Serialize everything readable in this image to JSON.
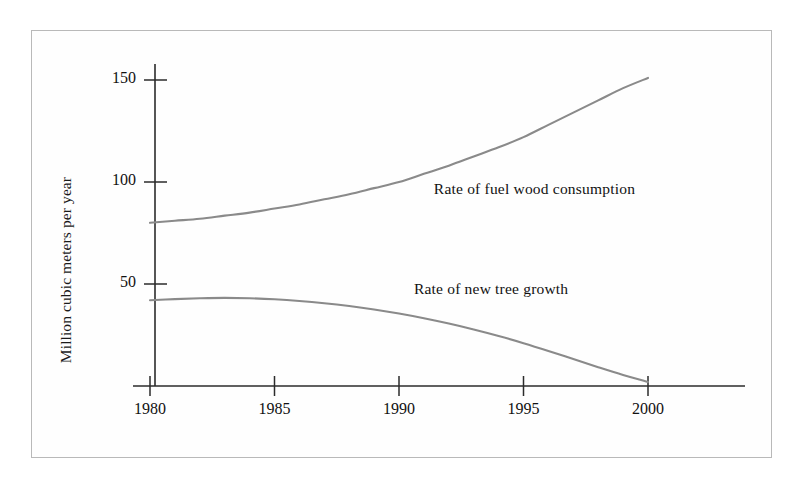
{
  "chart_data": {
    "type": "line",
    "title": "",
    "xlabel": "",
    "ylabel": "Million cubic meters per year",
    "xlim": [
      1980,
      2004
    ],
    "ylim": [
      0,
      165
    ],
    "xticks": [
      1980,
      1985,
      1990,
      1995,
      2000
    ],
    "xtick_labels": [
      "1980",
      "1985",
      "1990",
      "1995",
      "2000"
    ],
    "yticks": [
      50,
      100,
      150
    ],
    "ytick_labels": [
      "50",
      "100",
      "150"
    ],
    "grid": false,
    "legend_position": "inline-annotations",
    "line_color": "#8a8a8a",
    "axis_color": "#2b2b2b",
    "series": [
      {
        "name": "Rate of fuel wood consumption",
        "x": [
          1980,
          1981,
          1982,
          1983,
          1984,
          1985,
          1986,
          1987,
          1988,
          1989,
          1990,
          1991,
          1992,
          1993,
          1994,
          1995,
          1996,
          1997,
          1998,
          1999,
          2000
        ],
        "values": [
          80,
          81,
          82,
          83.5,
          85,
          87,
          89,
          91.5,
          94,
          97,
          100,
          104,
          108,
          112.5,
          117,
          122,
          128,
          134,
          140,
          146,
          151
        ]
      },
      {
        "name": "Rate of new tree growth",
        "x": [
          1980,
          1981,
          1982,
          1983,
          1984,
          1985,
          1986,
          1987,
          1988,
          1989,
          1990,
          1991,
          1992,
          1993,
          1994,
          1995,
          1996,
          1997,
          1998,
          1999,
          2000
        ],
        "values": [
          42,
          42.6,
          43,
          43.2,
          43,
          42.5,
          41.7,
          40.6,
          39.2,
          37.5,
          35.5,
          33.2,
          30.6,
          27.7,
          24.5,
          21,
          17.2,
          13.2,
          9.2,
          5.4,
          2
        ]
      }
    ],
    "annotations": [
      {
        "text": "Rate of fuel wood consumption",
        "x": 1991.4,
        "y": 96
      },
      {
        "text": "Rate of new tree growth",
        "x": 1990.6,
        "y": 47
      }
    ]
  }
}
